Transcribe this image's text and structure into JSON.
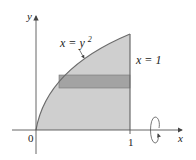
{
  "diagram": {
    "type": "region-revolution",
    "axes": {
      "x_label": "x",
      "y_label": "y",
      "origin_label": "0",
      "x_tick_label": "1"
    },
    "curves": [
      {
        "name": "parabola",
        "label_lhs": "x = y",
        "label_exp": "2",
        "equation": "x = y^2"
      },
      {
        "name": "vertical-line",
        "label": "x = 1",
        "equation": "x = 1"
      }
    ],
    "region": {
      "description": "region bounded by x = y^2, x = 1, y = 0",
      "fill": "#c8c8c8"
    },
    "strip": {
      "orientation": "horizontal",
      "fill": "#9a9a9a"
    },
    "rotation": {
      "axis": "x-axis",
      "symbol": "rotation-arrow"
    },
    "colors": {
      "region_fill": "#cfcfcf",
      "strip_fill": "#a3a3a3",
      "curve_stroke": "#6b6b6b",
      "axis_stroke": "#555555"
    }
  }
}
